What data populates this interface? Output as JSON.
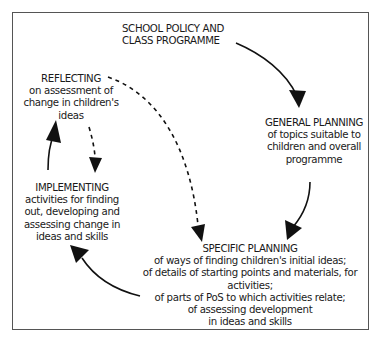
{
  "diagram": {
    "type": "planning cycle flow diagram",
    "nodes": [
      {
        "id": "policy",
        "title_lines": [
          "SCHOOL POLICY and",
          "CLASS PROGRAMME"
        ],
        "body_lines": []
      },
      {
        "id": "general_planning",
        "title_lines": [
          "GENERAL PLANNING"
        ],
        "body_lines": [
          "of topics suitable to",
          "children and overall",
          "programme"
        ]
      },
      {
        "id": "specific_planning",
        "title_lines": [
          "SPECIFIC PLANNING"
        ],
        "body_lines": [
          "of ways of finding children's initial ideas;",
          "of details of starting points and materials, for",
          "activities;",
          "of parts of PoS to which activities relate;",
          "of assessing development",
          "in ideas and skills"
        ]
      },
      {
        "id": "implementing",
        "title_lines": [
          "IMPLEMENTING"
        ],
        "body_lines": [
          "activities for finding",
          "out, developing and",
          "assessing change in",
          "ideas and skills"
        ]
      },
      {
        "id": "reflecting",
        "title_lines": [
          "REFLECTING"
        ],
        "body_lines": [
          "on assessment of",
          "change in children's",
          "ideas"
        ]
      }
    ],
    "edges": [
      {
        "from": "policy",
        "to": "general_planning",
        "style": "solid"
      },
      {
        "from": "general_planning",
        "to": "specific_planning",
        "style": "solid"
      },
      {
        "from": "specific_planning",
        "to": "implementing",
        "style": "solid"
      },
      {
        "from": "implementing",
        "to": "reflecting",
        "style": "solid"
      },
      {
        "from": "reflecting",
        "to": "implementing",
        "style": "dashed"
      },
      {
        "from": "reflecting",
        "to": "specific_planning",
        "style": "dashed"
      }
    ],
    "colors": {
      "line": "#111111",
      "frame": "#555555",
      "text": "#1a1a1a",
      "background": "#ffffff"
    }
  }
}
